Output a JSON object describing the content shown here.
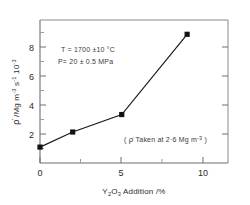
{
  "chart_data": {
    "type": "line",
    "title": "",
    "xlabel": "Y2O3 Addition /%",
    "ylabel": "ρ̇ /Mg m⁻³ s⁻¹ 10⁻³",
    "x": [
      0,
      2,
      5,
      9
    ],
    "values": [
      1.0,
      1.95,
      3.05,
      8.1
    ],
    "series": [
      {
        "name": "densification rate",
        "values": [
          1.0,
          1.95,
          3.05,
          8.1
        ]
      }
    ],
    "xlim": [
      0,
      11.5
    ],
    "ylim": [
      0,
      9.0
    ],
    "xticks": [
      "0",
      "5",
      "10"
    ],
    "xtick_values": [
      0,
      5,
      10
    ],
    "yticks": [
      "2",
      "4",
      "6",
      "8"
    ],
    "ytick_values": [
      2,
      4,
      6,
      8
    ],
    "grid": false,
    "legend": "none",
    "marker": "filled-square",
    "annotations": [
      "T = 1700 ± 10 °C",
      "P = 20 ± 0.5 MPa",
      "( ρ̇ Taken at 2.6 Mg m⁻³ )"
    ]
  },
  "axes": {
    "x_label_main": "Y",
    "x_label_sub1": "2",
    "x_label_mid": "O",
    "x_label_sub2": "3",
    "x_label_tail": " Addition /%",
    "y_label_rho": "ρ̇",
    "y_label_rest": " /Mg m",
    "y_label_sup1": "-3",
    "y_label_s": " s",
    "y_label_sup2": "-1",
    "y_label_ten": " 10",
    "y_label_sup3": "-3"
  },
  "ticklabels": {
    "x0": "0",
    "x5": "5",
    "x10": "10",
    "y2": "2",
    "y4": "4",
    "y6": "6",
    "y8": "8"
  },
  "annotations": {
    "temperature": "T = 1700 ±10 °C",
    "pressure": "P= 20 ± 0.5 MPa",
    "note_open": "( ",
    "note_rho": "ρ̇",
    "note_body": " Taken at 2·6 Mg m",
    "note_sup": "-3",
    "note_close": " )"
  },
  "colors": {
    "line": "#1a1a1a",
    "marker": "#121212",
    "axis": "#6e6e6e",
    "text": "#2b2b2b",
    "background": "#ffffff"
  }
}
